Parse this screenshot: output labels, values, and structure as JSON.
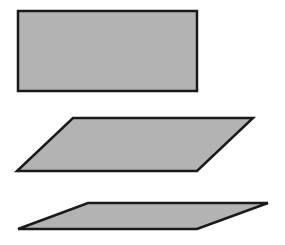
{
  "canvas": {
    "width": 285,
    "height": 245,
    "background": "#ffffff"
  },
  "style": {
    "fill": "#b3b3b3",
    "stroke": "#1a1a1a",
    "stroke_width": 2.5
  },
  "shapes": [
    {
      "name": "rectangle",
      "points": "18,11 197,11 197,91 18,91"
    },
    {
      "name": "parallelogram-medium",
      "points": "73,118 253,118 197,171 17,171"
    },
    {
      "name": "parallelogram-flat",
      "points": "88,203 268,203 197,229 18,229"
    }
  ]
}
